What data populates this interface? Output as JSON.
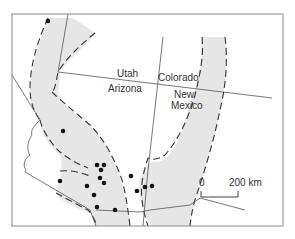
{
  "map": {
    "states": [
      {
        "name": "Utah",
        "x": 119,
        "y": 74
      },
      {
        "name": "Colorado",
        "x": 160,
        "y": 78
      },
      {
        "name": "Arizona",
        "x": 109,
        "y": 88
      },
      {
        "name": "New",
        "x": 175,
        "y": 94
      },
      {
        "name": "Mexico",
        "x": 172,
        "y": 105
      }
    ],
    "scale_bar": {
      "start_label": "0",
      "end_label": "200 km"
    },
    "dots": [
      [
        48,
        21
      ],
      [
        63,
        131
      ],
      [
        97,
        165
      ],
      [
        104,
        165
      ],
      [
        101,
        170
      ],
      [
        100,
        178
      ],
      [
        104,
        183
      ],
      [
        60,
        181
      ],
      [
        87,
        186
      ],
      [
        94,
        195
      ],
      [
        97,
        207
      ],
      [
        115,
        210
      ],
      [
        131,
        176
      ],
      [
        137,
        191
      ],
      [
        145,
        187
      ],
      [
        152,
        186
      ]
    ],
    "colors": {
      "band_fill": "#e6e6e6",
      "dash_line": "#333333",
      "border_line": "#555555",
      "dots": "#111111",
      "frame": "#888888"
    }
  }
}
